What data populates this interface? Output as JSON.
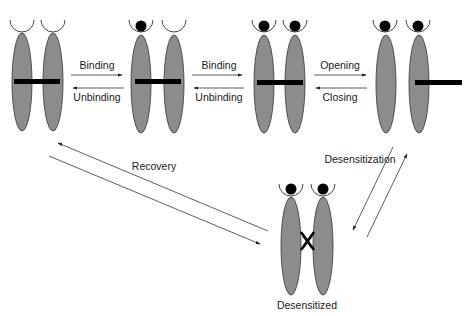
{
  "diagram": {
    "type": "receptor state transition scheme",
    "colors": {
      "subunit_fill": "#8c8c8c",
      "ligand": "#000000",
      "gate_bar": "#000000",
      "line": "#333333",
      "background": "#ffffff"
    },
    "states": [
      {
        "id": "s0",
        "description": "unbound closed",
        "ligands": 0
      },
      {
        "id": "s1",
        "description": "singly bound closed",
        "ligands": 1
      },
      {
        "id": "s2",
        "description": "doubly bound closed",
        "ligands": 2
      },
      {
        "id": "s3",
        "description": "doubly bound open",
        "ligands": 2
      },
      {
        "id": "s4",
        "description": "desensitized",
        "ligands": 2,
        "label": "Desensitized"
      }
    ],
    "transitions": [
      {
        "forward": "Binding",
        "reverse": "Unbinding",
        "from": "s0",
        "to": "s1"
      },
      {
        "forward": "Binding",
        "reverse": "Unbinding",
        "from": "s1",
        "to": "s2"
      },
      {
        "forward": "Opening",
        "reverse": "Closing",
        "from": "s2",
        "to": "s3"
      },
      {
        "forward": "Desensitization",
        "from": "s3",
        "to": "s4"
      },
      {
        "forward": "Recovery",
        "from": "s4",
        "to": "s0"
      }
    ],
    "labels": {
      "binding1": "Binding",
      "unbinding1": "Unbinding",
      "binding2": "Binding",
      "unbinding2": "Unbinding",
      "opening": "Opening",
      "closing": "Closing",
      "desensitization": "Desensitization",
      "recovery": "Recovery",
      "desensitized": "Desensitized"
    }
  }
}
